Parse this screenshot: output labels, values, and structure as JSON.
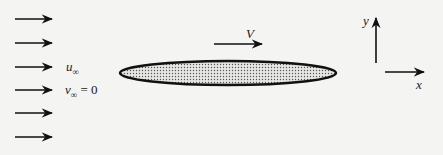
{
  "diagram": {
    "freestream": {
      "arrow_count": 6,
      "u_label": "u",
      "u_sub": "∞",
      "v_label": "v",
      "v_sub": "∞",
      "v_eq": "= 0"
    },
    "body": {
      "shape": "thin ellipse (stippled)",
      "velocity_label": "V"
    },
    "axes": {
      "y_label": "y",
      "x_label": "x"
    },
    "colors": {
      "background": "#f4f4f2",
      "ink": "#111111",
      "fill": "#d8d8d8"
    }
  }
}
